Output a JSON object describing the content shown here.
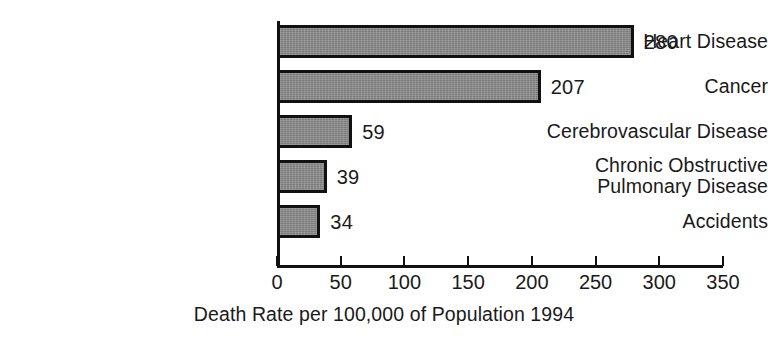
{
  "chart_data": {
    "type": "bar",
    "orientation": "horizontal",
    "title": "",
    "xlabel": "Death Rate per 100,000 of Population 1994",
    "ylabel": "",
    "categories": [
      "Heart Disease",
      "Cancer",
      "Cerebrovascular Disease",
      "Chronic Obstructive\nPulmonary Disease",
      "Accidents"
    ],
    "values": [
      280,
      207,
      59,
      39,
      34
    ],
    "data_labels": [
      "280",
      "207",
      "59",
      "39",
      "34"
    ],
    "xlim": [
      0,
      350
    ],
    "xticks": [
      0,
      50,
      100,
      150,
      200,
      250,
      300,
      350
    ],
    "xtick_labels": [
      "0",
      "50",
      "100",
      "150",
      "200",
      "250",
      "300",
      "350"
    ],
    "grid": false,
    "legend": null,
    "bar_fill_color": "#8a8a8a",
    "bar_edge_color": "#111111",
    "axis_color": "#111111",
    "background_color": "#ffffff",
    "text_color": "#1a1a1a"
  }
}
